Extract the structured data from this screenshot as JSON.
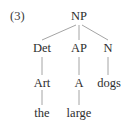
{
  "figure": {
    "example_number": "(3)",
    "caption": "",
    "background_color": "#ffffff",
    "text_color": "#2e2e2e",
    "line_color": "#9a9a9a"
  },
  "tree": {
    "root": "NP",
    "nodes": {
      "np": {
        "label": "NP",
        "x": 79,
        "y": 10
      },
      "det": {
        "label": "Det",
        "x": 42,
        "y": 42
      },
      "ap": {
        "label": "AP",
        "x": 79,
        "y": 42
      },
      "n": {
        "label": "N",
        "x": 108,
        "y": 42
      },
      "art": {
        "label": "Art",
        "x": 42,
        "y": 77
      },
      "a": {
        "label": "A",
        "x": 79,
        "y": 77
      },
      "dogs": {
        "label": "dogs",
        "x": 109,
        "y": 77
      },
      "the": {
        "label": "the",
        "x": 42,
        "y": 107
      },
      "large": {
        "label": "large",
        "x": 79,
        "y": 107
      }
    },
    "edges": [
      {
        "from": "np",
        "to": "det",
        "x1": 76,
        "y1": 25,
        "x2": 42,
        "y2": 40
      },
      {
        "from": "np",
        "to": "ap",
        "x1": 79,
        "y1": 25,
        "x2": 79,
        "y2": 40
      },
      {
        "from": "np",
        "to": "n",
        "x1": 82,
        "y1": 25,
        "x2": 108,
        "y2": 40
      },
      {
        "from": "det",
        "to": "art",
        "x1": 42,
        "y1": 57,
        "x2": 42,
        "y2": 75
      },
      {
        "from": "ap",
        "to": "a",
        "x1": 79,
        "y1": 57,
        "x2": 79,
        "y2": 75
      },
      {
        "from": "n",
        "to": "dogs",
        "x1": 108,
        "y1": 57,
        "x2": 108,
        "y2": 75
      },
      {
        "from": "art",
        "to": "the",
        "x1": 42,
        "y1": 90,
        "x2": 42,
        "y2": 105
      },
      {
        "from": "a",
        "to": "large",
        "x1": 79,
        "y1": 90,
        "x2": 79,
        "y2": 105
      }
    ],
    "bracketing": "[NP [Det [Art the]] [AP [A large]] [N dogs]]"
  }
}
